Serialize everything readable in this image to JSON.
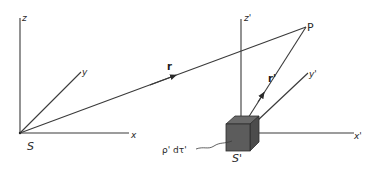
{
  "diagram": {
    "type": "coordinate-frames",
    "frame_s": {
      "origin_label": "S",
      "axes": {
        "x": "x",
        "y": "y",
        "z": "z"
      }
    },
    "frame_s_prime": {
      "origin_label": "S'",
      "axes": {
        "x": "x'",
        "y": "y'",
        "z": "z'"
      }
    },
    "point": {
      "label": "P"
    },
    "vectors": {
      "r": "r",
      "r_prime": "r'"
    },
    "element_label": "ρ' dτ'",
    "colors": {
      "line": "#3a3a3a",
      "cube_front": "#5a5a5a",
      "cube_top": "#6e6e6e",
      "cube_side": "#4a4a4a"
    }
  }
}
